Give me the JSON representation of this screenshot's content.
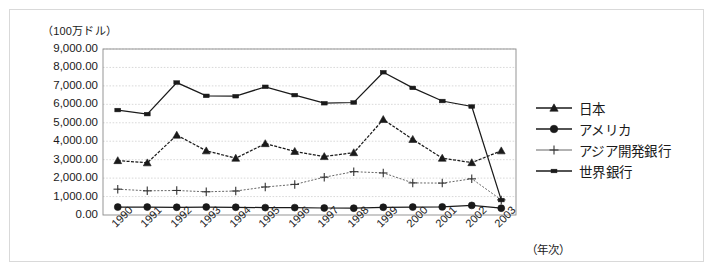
{
  "chart_data": {
    "type": "line",
    "title": "",
    "subtitle": "",
    "unit_label": "（100万ドル）",
    "xlabel": "（年次）",
    "ylabel": "",
    "grid": true,
    "legend_position": "right",
    "ylim": [
      0,
      9000
    ],
    "ytick_step": 1000,
    "ytick_labels": [
      "9,000.00",
      "8,000.00",
      "7,000.00",
      "6,000.00",
      "5,000.00",
      "4,000.00",
      "3,000.00",
      "2,000.00",
      "1,000.00",
      "0.00"
    ],
    "ytick_values": [
      9000,
      8000,
      7000,
      6000,
      5000,
      4000,
      3000,
      2000,
      1000,
      0
    ],
    "categories": [
      "1990",
      "1991",
      "1992",
      "1993",
      "1994",
      "1995",
      "1996",
      "1997",
      "1998",
      "1999",
      "2000",
      "2001",
      "2002",
      "2003"
    ],
    "series": [
      {
        "name": "日本",
        "marker": "triangle",
        "values": [
          2950,
          2830,
          4330,
          3480,
          3080,
          3870,
          3450,
          3170,
          3380,
          5180,
          4100,
          3080,
          2840,
          3480
        ]
      },
      {
        "name": "アメリカ",
        "marker": "circle",
        "values": [
          430,
          430,
          420,
          430,
          420,
          400,
          400,
          380,
          370,
          420,
          430,
          440,
          520,
          370
        ]
      },
      {
        "name": "アジア開発銀行",
        "marker": "plus",
        "values": [
          1400,
          1310,
          1330,
          1260,
          1300,
          1520,
          1660,
          2050,
          2350,
          2280,
          1740,
          1730,
          1960,
          820
        ]
      },
      {
        "name": "世界銀行",
        "marker": "square",
        "values": [
          5690,
          5470,
          7180,
          6460,
          6440,
          6950,
          6500,
          6060,
          6100,
          7740,
          6890,
          6180,
          5880,
          810
        ]
      }
    ]
  },
  "legend": {
    "items": [
      {
        "label": "日本",
        "marker": "triangle"
      },
      {
        "label": "アメリカ",
        "marker": "circle"
      },
      {
        "label": "アジア開発銀行",
        "marker": "plus"
      },
      {
        "label": "世界銀行",
        "marker": "square"
      }
    ]
  },
  "colors": {
    "series_line": "#1a1a1a",
    "grid": "#c8c8c8",
    "axis": "#555555",
    "background": "#ffffff"
  }
}
